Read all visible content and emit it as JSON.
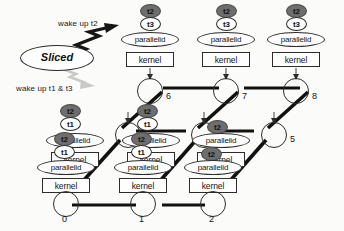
{
  "diagram": {
    "title_legend": "Sliced",
    "arrow_labels": {
      "top": "wake up t2",
      "bottom": "wake up t1 & t3"
    },
    "box_label": "kernel",
    "ellipse_label": "parallelid",
    "colors": {
      "active_thread_fill": "#6e6e6e",
      "idle_thread_fill": "#fdfdfd",
      "stroke": "#2c2c2c",
      "edge": "#111111",
      "gray_arrow": "#c9c9c9"
    },
    "nodes": [
      {
        "id": "0",
        "number": "0",
        "threads": [
          "t2",
          "t1"
        ],
        "stack": true
      },
      {
        "id": "1",
        "number": "1",
        "threads": [
          "t2",
          "t1"
        ],
        "stack": true
      },
      {
        "id": "2",
        "number": "2",
        "threads": [
          "t2"
        ],
        "stack": true
      },
      {
        "id": "3",
        "number": "3",
        "threads": [
          "t2",
          "t1"
        ],
        "stack": true
      },
      {
        "id": "4",
        "number": "4",
        "threads": [
          "t2",
          "t1"
        ],
        "stack": true
      },
      {
        "id": "5",
        "number": "5",
        "threads": [
          "t2"
        ],
        "stack": true
      },
      {
        "id": "6",
        "number": "6",
        "threads": [
          "t2",
          "t3"
        ],
        "stack": true
      },
      {
        "id": "7",
        "number": "7",
        "threads": [
          "t2",
          "t3"
        ],
        "stack": true
      },
      {
        "id": "8",
        "number": "8",
        "threads": [
          "t2",
          "t3"
        ],
        "stack": true
      }
    ],
    "thread_states": {
      "t1": "idle",
      "t2": "active",
      "t3": "idle"
    }
  }
}
